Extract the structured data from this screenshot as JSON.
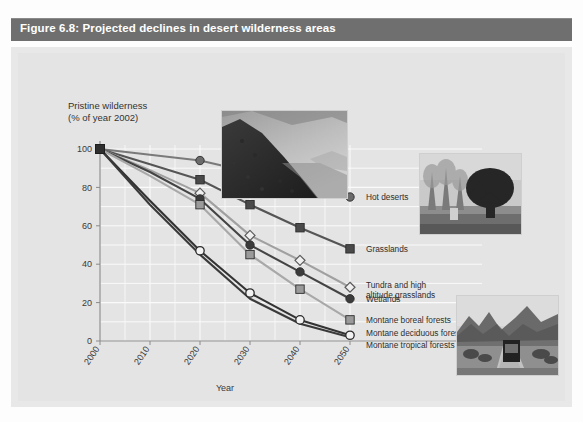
{
  "figure": {
    "title": "Figure 6.8: Projected declines in desert wilderness areas",
    "title_bar_color": "#6f6f6f",
    "panel_color": "#e8e8e8"
  },
  "photos": [
    {
      "name": "mountain-slope-photo",
      "caption": ""
    },
    {
      "name": "desert-tree-photo",
      "caption": ""
    },
    {
      "name": "desert-road-photo",
      "caption": ""
    }
  ],
  "chart_data": {
    "type": "line",
    "title": "Projected declines in desert wilderness areas",
    "xlabel": "Year",
    "ylabel": "Pristine wilderness\n(% of year 2002)",
    "ylabel_line1": "Pristine wilderness",
    "ylabel_line2": "(% of year 2002)",
    "x": [
      2000,
      2010,
      2020,
      2030,
      2040,
      2050
    ],
    "categories": [
      "2000",
      "2010",
      "2020",
      "2030",
      "2040",
      "2050"
    ],
    "xtick_labels": [
      "2000",
      "2010",
      "2020",
      "2030",
      "2040",
      "2050"
    ],
    "ytick_labels": [
      "0",
      "20",
      "40",
      "60",
      "80",
      "100"
    ],
    "yticks": [
      0,
      20,
      40,
      60,
      80,
      100
    ],
    "xlim": [
      2000,
      2050
    ],
    "ylim": [
      0,
      100
    ],
    "grid": true,
    "legend_position": "right-inline",
    "series": [
      {
        "name": "Hot deserts",
        "label": "Hot deserts",
        "marker": "circle-filled",
        "color": "#6b6b6b",
        "line_color": "#7a7a7a",
        "values": [
          100,
          97,
          94,
          88,
          81,
          75
        ],
        "label_y": 75
      },
      {
        "name": "Grasslands",
        "label": "Grasslands",
        "marker": "square-filled",
        "color": "#4a4a4a",
        "line_color": "#555555",
        "values": [
          100,
          92,
          84,
          71,
          59,
          48
        ],
        "label_y": 48
      },
      {
        "name": "Tundra and high altitude grasslands",
        "label": "Tundra and high\naltitude grasslands",
        "label_line1": "Tundra and high",
        "label_line2": "altitude grasslands",
        "marker": "diamond-open",
        "color": "#8d8d8d",
        "line_color": "#a0a0a0",
        "values": [
          100,
          89,
          77,
          55,
          42,
          28
        ],
        "label_y": 28
      },
      {
        "name": "Wetlands",
        "label": "Wetlands",
        "marker": "circle-dark",
        "color": "#3b3b3b",
        "line_color": "#444444",
        "values": [
          100,
          88,
          74,
          50,
          36,
          22
        ],
        "label_y": 22
      },
      {
        "name": "Montane boreal forests",
        "label": "Montane boreal forests",
        "marker": "square-light",
        "color": "#9a9a9a",
        "line_color": "#a8a8a8",
        "values": [
          100,
          86,
          71,
          45,
          27,
          11
        ],
        "label_y": 11
      },
      {
        "name": "Montane deciduous forests",
        "label": "Montane deciduous forests",
        "marker": "circle-open",
        "color": "#2f2f2f",
        "line_color": "#333333",
        "values": [
          100,
          73,
          47,
          25,
          11,
          3
        ],
        "label_y": 4
      },
      {
        "name": "Montane tropical forests",
        "label": "Montane tropical forests",
        "marker": "none",
        "color": "#2f2f2f",
        "line_color": "#3a3a3a",
        "values": [
          100,
          71,
          45,
          22,
          9,
          2
        ],
        "label_y": -2
      }
    ]
  }
}
